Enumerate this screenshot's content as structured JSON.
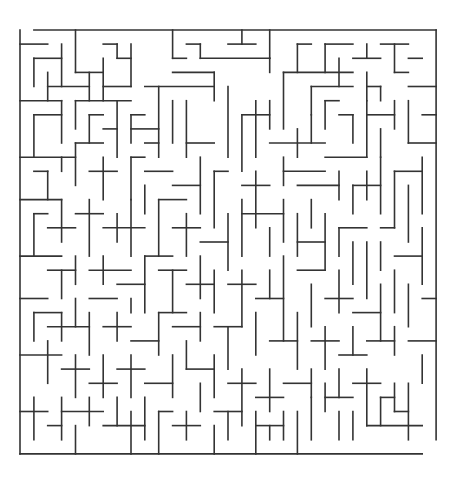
{
  "maze": {
    "cols": 30,
    "rows": 30,
    "origin": [
      20,
      30
    ],
    "cell_w": 13.87,
    "cell_h": 14.13,
    "wall_color": "#333333",
    "background": "#ffffff",
    "entrance": {
      "side": "top",
      "col": 0
    },
    "exit": {
      "side": "bottom",
      "col": 29
    },
    "segments": [
      [
        1,
        0,
        30,
        0
      ],
      [
        0,
        0,
        0,
        30
      ],
      [
        30,
        0,
        30,
        29
      ],
      [
        0,
        30,
        29,
        30
      ],
      [
        0,
        1,
        2,
        1
      ],
      [
        4,
        0,
        4,
        3
      ],
      [
        4,
        3,
        6,
        3
      ],
      [
        3,
        1,
        3,
        4
      ],
      [
        1,
        2,
        3,
        2
      ],
      [
        1,
        2,
        1,
        4
      ],
      [
        2,
        3,
        2,
        5
      ],
      [
        2,
        4,
        5,
        4
      ],
      [
        6,
        1,
        7,
        1
      ],
      [
        7,
        1,
        7,
        2
      ],
      [
        7,
        2,
        8,
        2
      ],
      [
        8,
        1,
        8,
        4
      ],
      [
        6,
        2,
        6,
        5
      ],
      [
        5,
        3,
        5,
        5
      ],
      [
        6,
        4,
        8,
        4
      ],
      [
        11,
        0,
        11,
        2
      ],
      [
        11,
        2,
        12,
        2
      ],
      [
        12,
        1,
        13,
        1
      ],
      [
        13,
        1,
        13,
        2
      ],
      [
        13,
        2,
        18,
        2
      ],
      [
        14,
        3,
        14,
        5
      ],
      [
        11,
        3,
        14,
        3
      ],
      [
        9,
        4,
        14,
        4
      ],
      [
        15,
        1,
        17,
        1
      ],
      [
        16,
        0,
        16,
        1
      ],
      [
        18,
        0,
        18,
        2
      ],
      [
        18,
        2,
        18,
        3
      ],
      [
        20,
        1,
        21,
        1
      ],
      [
        20,
        1,
        20,
        3
      ],
      [
        22,
        1,
        24,
        1
      ],
      [
        22,
        1,
        22,
        3
      ],
      [
        25,
        1,
        25,
        2
      ],
      [
        24,
        2,
        26,
        2
      ],
      [
        23,
        2,
        23,
        4
      ],
      [
        26,
        1,
        28,
        1
      ],
      [
        27,
        1,
        27,
        3
      ],
      [
        27,
        3,
        28,
        3
      ],
      [
        28,
        2,
        29,
        2
      ],
      [
        19,
        3,
        19,
        7
      ],
      [
        19,
        3,
        24,
        3
      ],
      [
        21,
        4,
        21,
        6
      ],
      [
        21,
        4,
        24,
        4
      ],
      [
        25,
        3,
        25,
        5
      ],
      [
        25,
        4,
        26,
        4
      ],
      [
        26,
        4,
        26,
        5
      ],
      [
        28,
        4,
        30,
        4
      ],
      [
        0,
        5,
        3,
        5
      ],
      [
        3,
        5,
        3,
        8
      ],
      [
        1,
        6,
        1,
        9
      ],
      [
        1,
        6,
        3,
        6
      ],
      [
        4,
        5,
        8,
        5
      ],
      [
        4,
        5,
        4,
        7
      ],
      [
        5,
        6,
        6,
        6
      ],
      [
        5,
        6,
        5,
        8
      ],
      [
        6,
        7,
        7,
        7
      ],
      [
        7,
        5,
        7,
        9
      ],
      [
        8,
        6,
        9,
        6
      ],
      [
        8,
        6,
        8,
        8
      ],
      [
        8,
        7,
        10,
        7
      ],
      [
        10,
        4,
        10,
        9
      ],
      [
        9,
        8,
        10,
        8
      ],
      [
        11,
        5,
        11,
        8
      ],
      [
        12,
        5,
        12,
        9
      ],
      [
        12,
        8,
        14,
        8
      ],
      [
        15,
        4,
        15,
        9
      ],
      [
        16,
        6,
        18,
        6
      ],
      [
        16,
        6,
        16,
        10
      ],
      [
        17,
        5,
        17,
        9
      ],
      [
        18,
        5,
        18,
        7
      ],
      [
        18,
        8,
        22,
        8
      ],
      [
        20,
        7,
        20,
        9
      ],
      [
        21,
        6,
        21,
        8
      ],
      [
        22,
        5,
        23,
        5
      ],
      [
        22,
        5,
        22,
        7
      ],
      [
        23,
        6,
        24,
        6
      ],
      [
        24,
        6,
        24,
        8
      ],
      [
        25,
        5,
        25,
        9
      ],
      [
        25,
        6,
        27,
        6
      ],
      [
        27,
        5,
        27,
        7
      ],
      [
        26,
        7,
        26,
        9
      ],
      [
        28,
        5,
        28,
        8
      ],
      [
        28,
        8,
        30,
        8
      ],
      [
        29,
        6,
        30,
        6
      ],
      [
        0,
        9,
        4,
        9
      ],
      [
        3,
        9,
        3,
        10
      ],
      [
        4,
        8,
        4,
        11
      ],
      [
        4,
        8,
        6,
        8
      ],
      [
        1,
        10,
        2,
        10
      ],
      [
        2,
        10,
        2,
        12
      ],
      [
        5,
        10,
        7,
        10
      ],
      [
        6,
        9,
        6,
        12
      ],
      [
        8,
        9,
        9,
        9
      ],
      [
        8,
        9,
        8,
        12
      ],
      [
        9,
        10,
        11,
        10
      ],
      [
        11,
        11,
        13,
        11
      ],
      [
        13,
        9,
        13,
        13
      ],
      [
        14,
        10,
        15,
        10
      ],
      [
        14,
        10,
        14,
        14
      ],
      [
        16,
        11,
        18,
        11
      ],
      [
        17,
        10,
        17,
        14
      ],
      [
        19,
        9,
        19,
        11
      ],
      [
        19,
        10,
        22,
        10
      ],
      [
        20,
        11,
        23,
        11
      ],
      [
        21,
        12,
        21,
        14
      ],
      [
        22,
        9,
        25,
        9
      ],
      [
        23,
        10,
        23,
        12
      ],
      [
        24,
        11,
        24,
        13
      ],
      [
        24,
        11,
        26,
        11
      ],
      [
        25,
        10,
        25,
        12
      ],
      [
        26,
        9,
        26,
        13
      ],
      [
        27,
        10,
        29,
        10
      ],
      [
        27,
        10,
        27,
        14
      ],
      [
        28,
        11,
        28,
        15
      ],
      [
        29,
        9,
        29,
        13
      ],
      [
        0,
        12,
        3,
        12
      ],
      [
        3,
        12,
        3,
        15
      ],
      [
        1,
        13,
        1,
        16
      ],
      [
        1,
        13,
        2,
        13
      ],
      [
        2,
        14,
        4,
        14
      ],
      [
        4,
        13,
        6,
        13
      ],
      [
        5,
        12,
        5,
        16
      ],
      [
        6,
        14,
        9,
        14
      ],
      [
        7,
        13,
        7,
        15
      ],
      [
        8,
        12,
        8,
        16
      ],
      [
        9,
        11,
        9,
        13
      ],
      [
        10,
        12,
        10,
        16
      ],
      [
        10,
        12,
        12,
        12
      ],
      [
        11,
        14,
        13,
        14
      ],
      [
        12,
        13,
        12,
        16
      ],
      [
        13,
        15,
        15,
        15
      ],
      [
        15,
        13,
        15,
        17
      ],
      [
        16,
        12,
        16,
        16
      ],
      [
        16,
        13,
        19,
        13
      ],
      [
        18,
        14,
        18,
        16
      ],
      [
        19,
        12,
        19,
        15
      ],
      [
        20,
        15,
        22,
        15
      ],
      [
        20,
        13,
        20,
        16
      ],
      [
        22,
        13,
        22,
        17
      ],
      [
        23,
        14,
        25,
        14
      ],
      [
        23,
        14,
        23,
        16
      ],
      [
        24,
        15,
        24,
        18
      ],
      [
        25,
        15,
        25,
        19
      ],
      [
        26,
        14,
        27,
        14
      ],
      [
        26,
        15,
        26,
        17
      ],
      [
        27,
        16,
        29,
        16
      ],
      [
        29,
        14,
        29,
        18
      ],
      [
        0,
        16,
        3,
        16
      ],
      [
        2,
        17,
        4,
        17
      ],
      [
        3,
        17,
        3,
        19
      ],
      [
        4,
        16,
        4,
        18
      ],
      [
        5,
        17,
        8,
        17
      ],
      [
        6,
        16,
        6,
        18
      ],
      [
        7,
        18,
        9,
        18
      ],
      [
        9,
        16,
        9,
        20
      ],
      [
        9,
        16,
        11,
        16
      ],
      [
        10,
        17,
        12,
        17
      ],
      [
        11,
        17,
        11,
        20
      ],
      [
        12,
        18,
        14,
        18
      ],
      [
        13,
        16,
        13,
        19
      ],
      [
        14,
        17,
        14,
        20
      ],
      [
        15,
        18,
        17,
        18
      ],
      [
        16,
        17,
        16,
        21
      ],
      [
        17,
        19,
        19,
        19
      ],
      [
        18,
        17,
        18,
        19
      ],
      [
        19,
        16,
        19,
        22
      ],
      [
        20,
        17,
        22,
        17
      ],
      [
        21,
        18,
        21,
        21
      ],
      [
        22,
        19,
        24,
        19
      ],
      [
        23,
        17,
        23,
        20
      ],
      [
        24,
        20,
        26,
        20
      ],
      [
        26,
        18,
        26,
        22
      ],
      [
        27,
        17,
        27,
        20
      ],
      [
        28,
        18,
        28,
        21
      ],
      [
        29,
        19,
        30,
        19
      ],
      [
        0,
        19,
        2,
        19
      ],
      [
        1,
        20,
        1,
        22
      ],
      [
        1,
        20,
        3,
        20
      ],
      [
        2,
        21,
        5,
        21
      ],
      [
        3,
        20,
        3,
        22
      ],
      [
        4,
        19,
        4,
        21
      ],
      [
        5,
        19,
        7,
        19
      ],
      [
        5,
        20,
        5,
        23
      ],
      [
        6,
        21,
        8,
        21
      ],
      [
        7,
        20,
        7,
        22
      ],
      [
        8,
        19,
        8,
        20
      ],
      [
        8,
        22,
        10,
        22
      ],
      [
        10,
        20,
        10,
        23
      ],
      [
        10,
        20,
        12,
        20
      ],
      [
        11,
        21,
        13,
        21
      ],
      [
        12,
        22,
        12,
        24
      ],
      [
        13,
        20,
        13,
        22
      ],
      [
        14,
        21,
        16,
        21
      ],
      [
        15,
        21,
        15,
        24
      ],
      [
        17,
        20,
        17,
        23
      ],
      [
        18,
        22,
        20,
        22
      ],
      [
        20,
        20,
        20,
        24
      ],
      [
        21,
        22,
        23,
        22
      ],
      [
        22,
        21,
        22,
        24
      ],
      [
        23,
        23,
        25,
        23
      ],
      [
        24,
        21,
        24,
        23
      ],
      [
        25,
        22,
        27,
        22
      ],
      [
        27,
        21,
        27,
        23
      ],
      [
        28,
        22,
        30,
        22
      ],
      [
        29,
        23,
        29,
        25
      ],
      [
        0,
        23,
        3,
        23
      ],
      [
        2,
        22,
        2,
        25
      ],
      [
        3,
        24,
        5,
        24
      ],
      [
        4,
        23,
        4,
        26
      ],
      [
        5,
        25,
        7,
        25
      ],
      [
        6,
        23,
        6,
        26
      ],
      [
        7,
        24,
        9,
        24
      ],
      [
        8,
        23,
        8,
        26
      ],
      [
        9,
        25,
        11,
        25
      ],
      [
        11,
        23,
        11,
        26
      ],
      [
        12,
        24,
        14,
        24
      ],
      [
        13,
        25,
        13,
        27
      ],
      [
        14,
        23,
        14,
        26
      ],
      [
        15,
        25,
        17,
        25
      ],
      [
        16,
        24,
        16,
        28
      ],
      [
        17,
        26,
        19,
        26
      ],
      [
        18,
        24,
        18,
        27
      ],
      [
        19,
        25,
        21,
        25
      ],
      [
        21,
        24,
        21,
        26
      ],
      [
        22,
        25,
        22,
        27
      ],
      [
        22,
        26,
        24,
        26
      ],
      [
        23,
        24,
        23,
        26
      ],
      [
        24,
        25,
        26,
        25
      ],
      [
        25,
        24,
        25,
        28
      ],
      [
        26,
        26,
        27,
        26
      ],
      [
        26,
        26,
        26,
        28
      ],
      [
        27,
        25,
        27,
        27
      ],
      [
        27,
        27,
        28,
        27
      ],
      [
        28,
        25,
        28,
        29
      ],
      [
        25,
        28,
        29,
        28
      ],
      [
        0,
        27,
        2,
        27
      ],
      [
        1,
        26,
        1,
        29
      ],
      [
        2,
        28,
        3,
        28
      ],
      [
        3,
        26,
        3,
        29
      ],
      [
        3,
        27,
        6,
        27
      ],
      [
        4,
        28,
        4,
        30
      ],
      [
        5,
        26,
        5,
        28
      ],
      [
        6,
        28,
        9,
        28
      ],
      [
        7,
        26,
        7,
        28
      ],
      [
        8,
        27,
        8,
        30
      ],
      [
        9,
        26,
        9,
        29
      ],
      [
        10,
        27,
        11,
        27
      ],
      [
        10,
        27,
        10,
        30
      ],
      [
        11,
        28,
        13,
        28
      ],
      [
        12,
        27,
        12,
        29
      ],
      [
        14,
        27,
        16,
        27
      ],
      [
        14,
        28,
        14,
        30
      ],
      [
        15,
        27,
        15,
        29
      ],
      [
        17,
        28,
        19,
        28
      ],
      [
        17,
        27,
        17,
        30
      ],
      [
        18,
        28,
        18,
        29
      ],
      [
        19,
        27,
        19,
        29
      ],
      [
        20,
        27,
        20,
        30
      ],
      [
        21,
        26,
        21,
        29
      ],
      [
        23,
        27,
        23,
        29
      ],
      [
        24,
        27,
        24,
        29
      ]
    ]
  }
}
